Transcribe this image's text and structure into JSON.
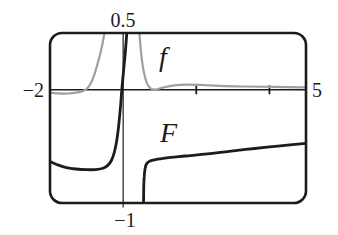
{
  "figure": {
    "type": "calculator-viewing-window-plot",
    "labels": {
      "ymax": "0.5",
      "xmin": "−2",
      "xmax": "5",
      "ymin": "−1"
    },
    "colors": {
      "ink": "#1c1c1c",
      "f_curve": "#a0a0a0",
      "background": "#ffffff"
    }
  },
  "chart_data": {
    "type": "line",
    "window": {
      "xmin": -2,
      "xmax": 5,
      "ymin": -1,
      "ymax": 0.5
    },
    "x_tick_positions": [
      2,
      4
    ],
    "x_tick_interval": 2,
    "axes": {
      "x_axis_y": 0,
      "y_axis_x": 0,
      "grid": false
    },
    "legend_position": "on-curve",
    "series": [
      {
        "name": "f",
        "color": "#a0a0a0",
        "stroke_width": 2.2,
        "branches": [
          [
            [
              -2,
              -0.026
            ],
            [
              -1.75,
              -0.033
            ],
            [
              -1.5,
              -0.034
            ],
            [
              -1.28,
              -0.027
            ],
            [
              -1.1,
              -0.013
            ],
            [
              -0.98,
              0.012
            ],
            [
              -0.88,
              0.06
            ],
            [
              -0.78,
              0.14
            ],
            [
              -0.68,
              0.25
            ],
            [
              -0.58,
              0.38
            ],
            [
              -0.5,
              0.52
            ]
          ],
          [
            [
              0.44,
              0.52
            ],
            [
              0.47,
              0.4
            ],
            [
              0.51,
              0.27
            ],
            [
              0.57,
              0.15
            ],
            [
              0.65,
              0.058
            ],
            [
              0.74,
              0.014
            ],
            [
              0.84,
              0
            ],
            [
              0.95,
              0.006
            ],
            [
              1.12,
              0.022
            ],
            [
              1.4,
              0.038
            ],
            [
              1.75,
              0.044
            ],
            [
              2.15,
              0.041
            ],
            [
              2.65,
              0.034
            ],
            [
              3.3,
              0.028
            ],
            [
              4.1,
              0.024
            ],
            [
              5,
              0.021
            ]
          ]
        ]
      },
      {
        "name": "F",
        "color": "#1c1c1c",
        "stroke_width": 2.8,
        "branches": [
          [
            [
              -2,
              -0.635
            ],
            [
              -1.8,
              -0.662
            ],
            [
              -1.55,
              -0.688
            ],
            [
              -1.3,
              -0.7
            ],
            [
              -1,
              -0.706
            ],
            [
              -0.75,
              -0.705
            ],
            [
              -0.55,
              -0.693
            ],
            [
              -0.42,
              -0.668
            ],
            [
              -0.32,
              -0.625
            ],
            [
              -0.24,
              -0.55
            ],
            [
              -0.17,
              -0.44
            ],
            [
              -0.115,
              -0.3
            ],
            [
              -0.07,
              -0.14
            ],
            [
              -0.03,
              0.02
            ],
            [
              0.015,
              0.18
            ],
            [
              0.06,
              0.33
            ],
            [
              0.105,
              0.52
            ]
          ],
          [
            [
              0.558,
              -1
            ],
            [
              0.562,
              -0.88
            ],
            [
              0.575,
              -0.77
            ],
            [
              0.6,
              -0.695
            ],
            [
              0.645,
              -0.652
            ],
            [
              0.735,
              -0.63
            ],
            [
              0.85,
              -0.62
            ],
            [
              1,
              -0.611
            ],
            [
              1.3,
              -0.598
            ],
            [
              1.7,
              -0.585
            ],
            [
              2.3,
              -0.567
            ],
            [
              2.9,
              -0.544
            ],
            [
              3.6,
              -0.519
            ],
            [
              4.3,
              -0.496
            ],
            [
              5,
              -0.474
            ]
          ]
        ]
      }
    ]
  }
}
